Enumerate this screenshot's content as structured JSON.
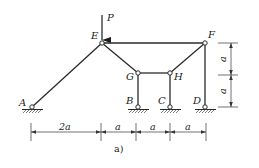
{
  "figure": {
    "caption": "a)",
    "load": {
      "label": "P",
      "direction": "down",
      "applied_at": "E"
    },
    "nodes": {
      "A": {
        "label": "A",
        "x": 32,
        "y": 107,
        "support": "pin"
      },
      "B": {
        "label": "B",
        "x": 138,
        "y": 107,
        "support": "pin"
      },
      "C": {
        "label": "C",
        "x": 170,
        "y": 107,
        "support": "pin"
      },
      "D": {
        "label": "D",
        "x": 205,
        "y": 107,
        "support": "pin"
      },
      "E": {
        "label": "E",
        "x": 102,
        "y": 43
      },
      "F": {
        "label": "F",
        "x": 205,
        "y": 43
      },
      "G": {
        "label": "G",
        "x": 138,
        "y": 73
      },
      "H": {
        "label": "H",
        "x": 170,
        "y": 73
      }
    },
    "members": [
      [
        "A",
        "E"
      ],
      [
        "E",
        "F"
      ],
      [
        "E",
        "G"
      ],
      [
        "G",
        "H"
      ],
      [
        "H",
        "F"
      ],
      [
        "G",
        "B"
      ],
      [
        "H",
        "C"
      ],
      [
        "F",
        "D"
      ]
    ],
    "horizontal_dimensions": [
      "2a",
      "a",
      "a",
      "a"
    ],
    "vertical_dimensions": [
      "a",
      "a"
    ]
  }
}
